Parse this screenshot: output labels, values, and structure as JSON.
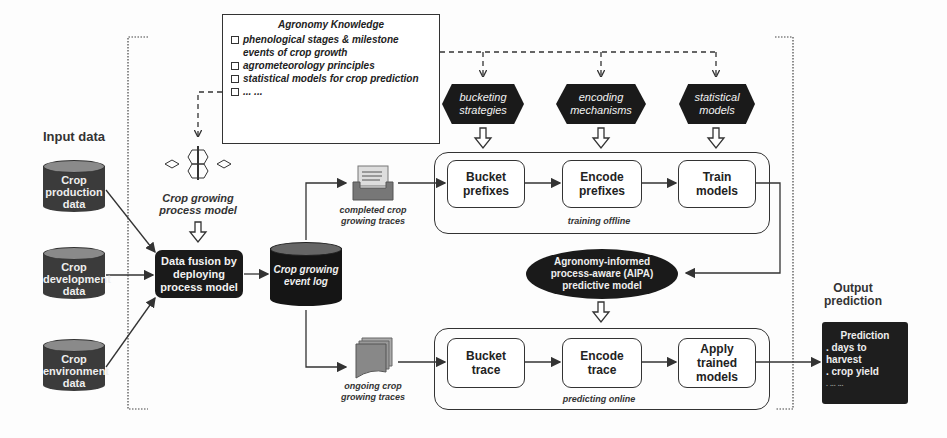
{
  "input": {
    "heading": "Input data",
    "sources": [
      {
        "label_1": "Crop",
        "label_2": "production",
        "label_3": "data"
      },
      {
        "label_1": "Crop",
        "label_2": "development",
        "label_3": "data"
      },
      {
        "label_1": "Crop",
        "label_2": "environment",
        "label_3": "data"
      }
    ]
  },
  "knowledge": {
    "title": "Agronomy Knowledge",
    "items": [
      "phenological stages & milestone",
      "agrometeorology principles",
      "statistical models for crop prediction",
      "... ..."
    ],
    "item_0_cont": "events of crop growth"
  },
  "process_model": {
    "line_1": "Crop growing",
    "line_2": "process model"
  },
  "fusion": {
    "line_1": "Data fusion by",
    "line_2": "deploying",
    "line_3": "process model"
  },
  "event_log": {
    "line_1": "Crop growing",
    "line_2": "event log"
  },
  "completed_traces": {
    "line_1": "completed crop",
    "line_2": "growing traces"
  },
  "ongoing_traces": {
    "line_1": "ongoing crop",
    "line_2": "growing traces"
  },
  "strategies": [
    {
      "line_1": "bucketing",
      "line_2": "strategies"
    },
    {
      "line_1": "encoding",
      "line_2": "mechanisms"
    },
    {
      "line_1": "statistical",
      "line_2": "models"
    }
  ],
  "training": {
    "caption": "training offline",
    "steps": [
      {
        "line_1": "Bucket",
        "line_2": "prefixes"
      },
      {
        "line_1": "Encode",
        "line_2": "prefixes"
      },
      {
        "line_1": "Train",
        "line_2": "models"
      }
    ]
  },
  "aipa": {
    "line_1": "Agronomy-informed",
    "line_2": "process-aware (AIPA)",
    "line_3": "predictive model"
  },
  "predicting": {
    "caption": "predicting online",
    "steps": [
      {
        "line_1": "Bucket",
        "line_2": "trace"
      },
      {
        "line_1": "Encode",
        "line_2": "trace"
      },
      {
        "line_1": "Apply",
        "line_2": "trained",
        "line_3": "models"
      }
    ]
  },
  "output": {
    "heading_1": "Output",
    "heading_2": "prediction",
    "title": "Prediction",
    "items": [
      ". days to harvest",
      ". crop yield",
      ". ... ..."
    ]
  },
  "colors": {
    "dark": "#1a1a1a",
    "cylinder_body": "#3b3b3b",
    "cylinder_top": "#8a8a8a",
    "line": "#333333"
  }
}
